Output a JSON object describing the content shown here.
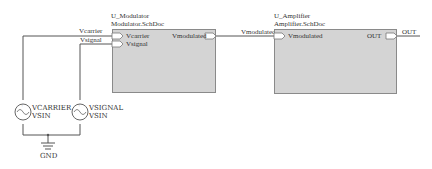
{
  "sheets": [
    {
      "designator": "U_Modulator",
      "filename": "Modulator.SchDoc",
      "inputs": [
        "Vcarrier",
        "Vsignal"
      ],
      "outputs": [
        "Vmodulated"
      ]
    },
    {
      "designator": "U_Amplifier",
      "filename": "Amplifier.SchDoc",
      "inputs": [
        "Vmodulated"
      ],
      "outputs": [
        "OUT"
      ]
    }
  ],
  "nets": {
    "carrier": "Vcarrier",
    "signal": "Vsignal",
    "modulated": "Vmodulated",
    "out": "OUT"
  },
  "sources": [
    {
      "designator": "VCARRIER",
      "type": "VSIN"
    },
    {
      "designator": "VSIGNAL",
      "type": "VSIN"
    }
  ],
  "ground": {
    "label": "GND"
  },
  "colors": {
    "wire": "#555555",
    "sheet_fill": "#d4d4d4",
    "sheet_border": "#8a8a8a",
    "text": "#333333"
  }
}
